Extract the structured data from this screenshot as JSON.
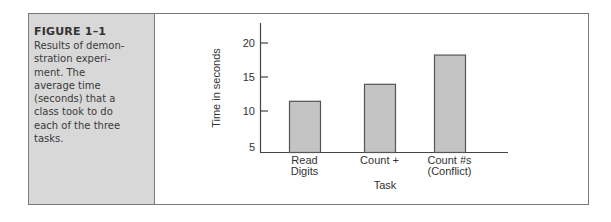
{
  "figure": {
    "label": "FIGURE 1–1",
    "caption_lines": [
      "Results of demon-",
      "stration experi-",
      "ment. The",
      "average time",
      "(seconds) that a",
      "class took to do",
      "each of the three",
      "tasks."
    ]
  },
  "chart_data": {
    "type": "bar",
    "title": "",
    "categories": [
      "Read Digits",
      "Count +",
      "Count #s (Conflict)"
    ],
    "category_label_lines": [
      [
        "Read",
        "Digits"
      ],
      [
        "Count +"
      ],
      [
        "Count #s",
        "(Conflict)"
      ]
    ],
    "values": [
      11.5,
      14,
      18.3
    ],
    "xlabel": "Task",
    "ylabel": "Time in seconds",
    "ylim": [
      5,
      21
    ],
    "yticks": [
      5,
      10,
      15,
      20
    ],
    "grid": false,
    "legend": null,
    "bar_color": "#c4c4c4",
    "bar_edge_color": "#555555"
  }
}
